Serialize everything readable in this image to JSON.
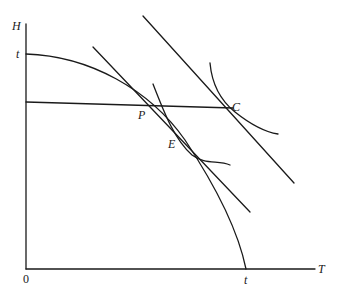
{
  "diagram": {
    "axes": {
      "y_label": "H",
      "x_label": "T",
      "origin_label": "0",
      "y_intercept_label": "t",
      "x_intercept_label": "t"
    },
    "points": {
      "P": "P",
      "E": "E",
      "C": "C"
    },
    "elements": [
      "vertical axis H",
      "horizontal axis T",
      "concave frontier curve from (0,t) to (t,0)",
      "horizontal budget line through P to C",
      "tangent line through P and E",
      "tangent line through C",
      "indifference curve tangent at E",
      "indifference curve tangent at C"
    ]
  }
}
